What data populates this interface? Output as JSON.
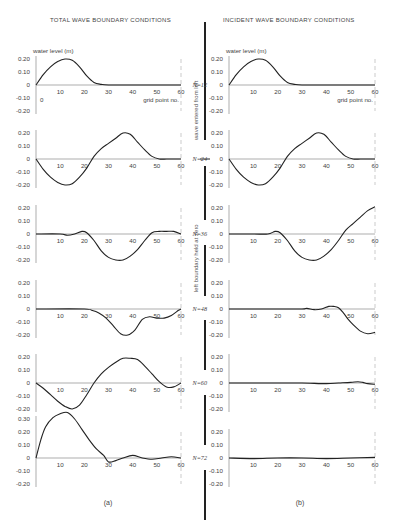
{
  "figure": {
    "left_title": "TOTAL WAVE BOUNDARY CONDITIONS",
    "right_title": "INCIDENT WAVE BOUNDARY CONDITIONS",
    "y_axis_label": "water level (m)",
    "x_axis_label": "grid point no.",
    "left_caption": "(a)",
    "right_caption": "(b)",
    "annotation_upper": "wave entered from left",
    "annotation_lower": "left boundary held at zero",
    "first_panel_origin_label": "0"
  },
  "chart_data": [
    {
      "type": "line",
      "title": "TOTAL WAVE BOUNDARY CONDITIONS",
      "panel": "(a)",
      "xlabel": "grid point no.",
      "ylabel": "water level (m)",
      "xlim": [
        0,
        60
      ],
      "ylim": [
        -0.2,
        0.2
      ],
      "x_ticks": [
        10,
        20,
        30,
        40,
        50,
        60
      ],
      "y_ticks": [
        "0.20",
        "0.10",
        "0",
        "-0.10",
        "-0.20"
      ],
      "series": [
        {
          "name": "N=12",
          "x": [
            0,
            3,
            6,
            9,
            12,
            15,
            18,
            21,
            24,
            27,
            30,
            40,
            50,
            60
          ],
          "values": [
            0,
            0.08,
            0.14,
            0.18,
            0.2,
            0.19,
            0.14,
            0.07,
            0.02,
            0.005,
            0,
            0,
            0,
            0
          ]
        },
        {
          "name": "N=24",
          "x": [
            0,
            3,
            6,
            9,
            12,
            15,
            18,
            21,
            24,
            27,
            30,
            33,
            36,
            39,
            42,
            45,
            48,
            51,
            54,
            57,
            60
          ],
          "values": [
            0,
            -0.08,
            -0.14,
            -0.18,
            -0.2,
            -0.19,
            -0.14,
            -0.07,
            0.02,
            0.08,
            0.12,
            0.16,
            0.2,
            0.19,
            0.13,
            0.07,
            0.02,
            0,
            0,
            0,
            0
          ]
        },
        {
          "name": "N=36",
          "x": [
            0,
            10,
            13,
            16,
            19,
            21,
            24,
            27,
            30,
            33,
            36,
            39,
            42,
            45,
            48,
            51,
            54,
            57,
            60
          ],
          "values": [
            0,
            0,
            -0.01,
            0,
            0.02,
            0.01,
            -0.05,
            -0.13,
            -0.18,
            -0.2,
            -0.2,
            -0.17,
            -0.12,
            -0.05,
            0.01,
            0.02,
            0.02,
            0.02,
            0
          ]
        },
        {
          "name": "N=48",
          "x": [
            0,
            20,
            23,
            26,
            29,
            32,
            35,
            38,
            41,
            44,
            47,
            50,
            53,
            56,
            59,
            60
          ],
          "values": [
            0,
            0,
            -0.01,
            -0.03,
            -0.07,
            -0.13,
            -0.19,
            -0.2,
            -0.16,
            -0.08,
            -0.06,
            -0.07,
            -0.07,
            -0.05,
            -0.01,
            0
          ]
        },
        {
          "name": "N=60",
          "x": [
            0,
            3,
            6,
            9,
            12,
            15,
            18,
            21,
            24,
            27,
            30,
            33,
            36,
            39,
            42,
            45,
            48,
            51,
            54,
            57,
            60
          ],
          "values": [
            0,
            -0.04,
            -0.09,
            -0.14,
            -0.18,
            -0.2,
            -0.17,
            -0.09,
            0,
            0.07,
            0.12,
            0.16,
            0.19,
            0.19,
            0.18,
            0.13,
            0.07,
            0.01,
            -0.03,
            -0.03,
            0
          ]
        },
        {
          "name": "N=72",
          "x": [
            0,
            2,
            4,
            7,
            10,
            13,
            16,
            19,
            22,
            25,
            28,
            30,
            33,
            36,
            40,
            44,
            48,
            52,
            56,
            60
          ],
          "values": [
            0,
            0.14,
            0.24,
            0.31,
            0.34,
            0.35,
            0.3,
            0.22,
            0.14,
            0.07,
            0.02,
            -0.03,
            -0.02,
            0,
            0.02,
            0,
            -0.01,
            0,
            0.01,
            0
          ]
        }
      ]
    },
    {
      "type": "line",
      "title": "INCIDENT WAVE BOUNDARY CONDITIONS",
      "panel": "(b)",
      "xlabel": "grid point no.",
      "ylabel": "water level (m)",
      "xlim": [
        0,
        60
      ],
      "ylim": [
        -0.2,
        0.2
      ],
      "x_ticks": [
        10,
        20,
        30,
        40,
        50,
        60
      ],
      "y_ticks": [
        "0.20",
        "0.10",
        "0",
        "-0.10",
        "-0.20"
      ],
      "series": [
        {
          "name": "N=12",
          "x": [
            0,
            3,
            6,
            9,
            12,
            15,
            18,
            21,
            24,
            27,
            30,
            40,
            50,
            60
          ],
          "values": [
            0,
            0.08,
            0.14,
            0.18,
            0.2,
            0.19,
            0.14,
            0.07,
            0.02,
            0.005,
            0,
            0,
            0,
            0
          ]
        },
        {
          "name": "N=24",
          "x": [
            0,
            3,
            6,
            9,
            12,
            15,
            18,
            21,
            24,
            27,
            30,
            33,
            36,
            39,
            42,
            45,
            48,
            51,
            54,
            57,
            60
          ],
          "values": [
            0,
            -0.08,
            -0.14,
            -0.18,
            -0.2,
            -0.19,
            -0.14,
            -0.07,
            0.02,
            0.08,
            0.12,
            0.16,
            0.2,
            0.19,
            0.13,
            0.07,
            0.02,
            0,
            0,
            0,
            0
          ]
        },
        {
          "name": "N=36",
          "x": [
            0,
            10,
            16,
            19,
            21,
            24,
            27,
            30,
            33,
            36,
            39,
            42,
            45,
            48,
            51,
            54,
            57,
            60
          ],
          "values": [
            0,
            0,
            0,
            0.02,
            0.01,
            -0.05,
            -0.13,
            -0.18,
            -0.2,
            -0.2,
            -0.17,
            -0.12,
            -0.05,
            0.03,
            0.08,
            0.13,
            0.18,
            0.21
          ]
        },
        {
          "name": "N=48",
          "x": [
            0,
            10,
            20,
            30,
            32,
            35,
            38,
            41,
            43,
            45,
            47,
            49,
            51,
            54,
            57,
            60
          ],
          "values": [
            0,
            0,
            0,
            0,
            0.005,
            -0.005,
            0,
            0.02,
            0.02,
            0.01,
            -0.03,
            -0.08,
            -0.12,
            -0.17,
            -0.19,
            -0.18
          ]
        },
        {
          "name": "N=60",
          "x": [
            0,
            10,
            20,
            30,
            40,
            45,
            50,
            53,
            55,
            57,
            60
          ],
          "values": [
            0,
            0,
            0,
            0,
            -0.005,
            0,
            0.005,
            0.01,
            0.005,
            -0.005,
            -0.01
          ]
        },
        {
          "name": "N=72",
          "x": [
            0,
            10,
            20,
            30,
            40,
            50,
            60
          ],
          "values": [
            0,
            -0.005,
            0,
            0,
            -0.005,
            0,
            0.005
          ]
        }
      ]
    }
  ],
  "panels": {
    "n_labels": [
      "N=12",
      "N=24",
      "N=36",
      "N=48",
      "N=60",
      "N=72"
    ]
  }
}
